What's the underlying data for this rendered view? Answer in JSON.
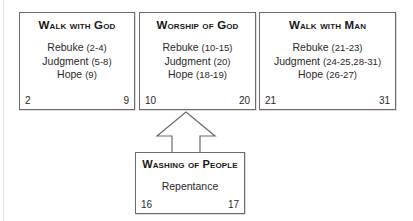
{
  "diagram": {
    "type": "flow-diagram",
    "arrow": {
      "name": "up-arrow",
      "direction": "up",
      "from": "Washing of People",
      "to": "Worship of God"
    },
    "boxes": [
      {
        "id": "walk-with-god",
        "title": "Walk with God",
        "lines": [
          {
            "label": "Rebuke",
            "ref": "(2-4)"
          },
          {
            "label": "Judgment",
            "ref": "(5-8)"
          },
          {
            "label": "Hope",
            "ref": "(9)"
          }
        ],
        "range_start": "2",
        "range_end": "9"
      },
      {
        "id": "worship-of-god",
        "title": "Worship of God",
        "lines": [
          {
            "label": "Rebuke",
            "ref": "(10-15)"
          },
          {
            "label": "Judgment",
            "ref": "(20)"
          },
          {
            "label": "Hope",
            "ref": "(18-19)"
          }
        ],
        "range_start": "10",
        "range_end": "20"
      },
      {
        "id": "walk-with-man",
        "title": "Walk with Man",
        "lines": [
          {
            "label": "Rebuke",
            "ref": "(21-23)"
          },
          {
            "label": "Judgment",
            "ref": "(24-25,28-31)"
          },
          {
            "label": "Hope",
            "ref": "(26-27)"
          }
        ],
        "range_start": "21",
        "range_end": "31"
      },
      {
        "id": "washing-of-people",
        "title": "Washing of People",
        "lines": [
          {
            "label": "Repentance",
            "ref": ""
          }
        ],
        "range_start": "16",
        "range_end": "17"
      }
    ],
    "colors": {
      "border": "#6e6a69",
      "text": "#231f20",
      "background": "#ffffff"
    }
  }
}
